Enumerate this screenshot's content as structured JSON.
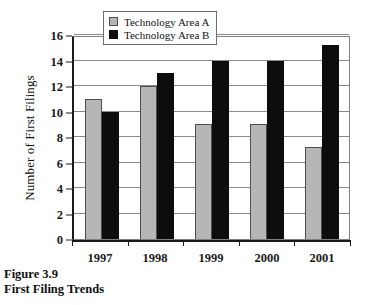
{
  "figure": {
    "caption_line1": "Figure 3.9",
    "caption_line2": "First Filing Trends"
  },
  "chart_data": {
    "type": "bar",
    "title": "",
    "xlabel": "",
    "ylabel": "Number of First Filings",
    "categories": [
      "1997",
      "1998",
      "1999",
      "2000",
      "2001"
    ],
    "series": [
      {
        "name": "Technology Area A",
        "color": "#b6b6b6",
        "values": [
          11,
          12,
          9,
          9,
          7.2
        ]
      },
      {
        "name": "Technology Area B",
        "color": "#0d0d0d",
        "values": [
          10,
          13,
          14,
          14,
          15.2
        ]
      }
    ],
    "ylim": [
      0,
      16
    ],
    "ytick_step": 2,
    "yticks": [
      "0",
      "2",
      "4",
      "6",
      "8",
      "10",
      "12",
      "14",
      "16"
    ],
    "grid": true,
    "legend_position": "top-left-inside"
  }
}
